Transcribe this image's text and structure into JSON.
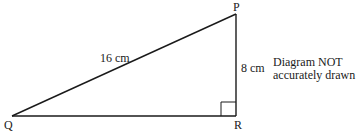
{
  "diagram": {
    "type": "right-triangle",
    "vertices": {
      "P": {
        "label": "P",
        "x": 236,
        "y": 14
      },
      "Q": {
        "label": "Q",
        "x": 12,
        "y": 116
      },
      "R": {
        "label": "R",
        "x": 236,
        "y": 116
      }
    },
    "right_angle_at": "R",
    "sides": {
      "QP": {
        "label": "16 cm",
        "length_cm": 16
      },
      "PR": {
        "label": "8 cm",
        "length_cm": 8
      },
      "QR": {
        "label": "",
        "length_cm": null
      }
    },
    "note": {
      "line1": "Diagram NOT",
      "line2": "accurately drawn"
    },
    "colors": {
      "stroke": "#1a1a1a",
      "background": "#ffffff"
    }
  }
}
